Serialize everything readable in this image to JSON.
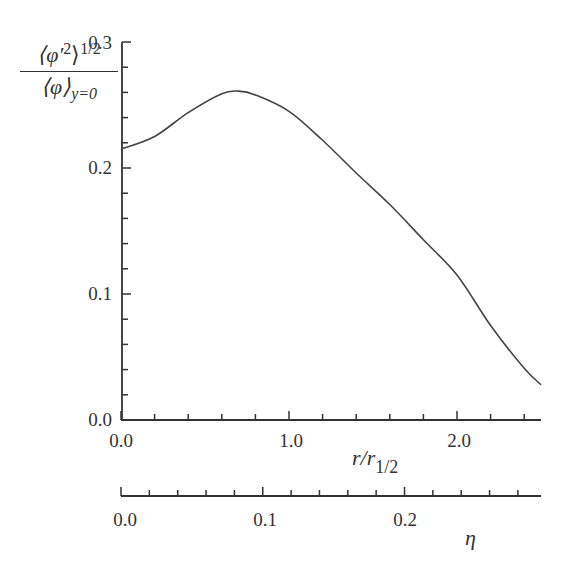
{
  "chart_data": {
    "type": "line",
    "title": "",
    "xlabel": "r/r_1/2",
    "xlabel_secondary": "η",
    "ylabel": "⟨φ'²⟩^(1/2) / ⟨φ⟩_(y=0)",
    "xlim": [
      0.0,
      2.5
    ],
    "ylim": [
      0.0,
      0.3
    ],
    "x_secondary_lim": [
      0.0,
      0.28
    ],
    "grid": false,
    "legend": null,
    "x_ticks": [
      "0.0",
      "1.0",
      "2.0"
    ],
    "y_ticks": [
      "0.0",
      "0.1",
      "0.2",
      "0.3"
    ],
    "x_secondary_ticks": [
      "0.0",
      "0.1",
      "0.2"
    ],
    "series": [
      {
        "name": "rms fluctuation profile",
        "x": [
          0.0,
          0.2,
          0.4,
          0.6,
          0.7,
          0.8,
          1.0,
          1.2,
          1.4,
          1.6,
          1.8,
          2.0,
          2.2,
          2.4,
          2.5
        ],
        "values": [
          0.215,
          0.225,
          0.244,
          0.259,
          0.261,
          0.258,
          0.245,
          0.222,
          0.196,
          0.171,
          0.143,
          0.115,
          0.075,
          0.041,
          0.028
        ]
      }
    ]
  },
  "labels": {
    "y_num_main": "⟨φ′",
    "y_num_sup2": "2",
    "y_num_close": "⟩",
    "y_num_sup": "1/2",
    "y_den_main": "⟨φ⟩",
    "y_den_sub": "y=0",
    "x_main": "r/r",
    "x_sub": "1/2",
    "x_secondary": "η",
    "x_tick_0": "0.0",
    "x_tick_1": "1.0",
    "x_tick_2": "2.0",
    "y_tick_0": "0.0",
    "y_tick_1": "0.1",
    "y_tick_2": "0.2",
    "y_tick_3": "0.3",
    "eta_tick_0": "0.0",
    "eta_tick_1": "0.1",
    "eta_tick_2": "0.2"
  }
}
